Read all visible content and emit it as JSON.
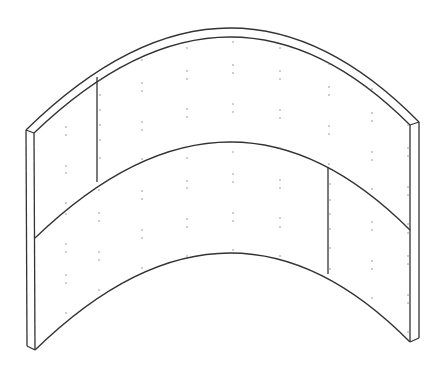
{
  "figure": {
    "colors": {
      "background": "#ffffff",
      "stroke": "#333333",
      "fastener": "#777777"
    },
    "panels": [
      {
        "id": "upper-left"
      },
      {
        "id": "upper-main"
      },
      {
        "id": "lower-main"
      },
      {
        "id": "lower-right"
      }
    ]
  }
}
